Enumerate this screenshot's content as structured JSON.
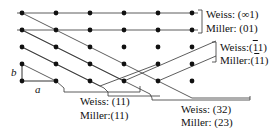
{
  "diagram": {
    "title": "",
    "lattice": {
      "columns_x": [
        22,
        56,
        90,
        124,
        158,
        192
      ],
      "rows_y": [
        13,
        30,
        47,
        64,
        81
      ],
      "dot_color": "#111111",
      "line_color": "#333333"
    },
    "axis_labels": {
      "a": "a",
      "b": "b"
    },
    "planes": [
      {
        "weiss": "Weiss: (∞1)",
        "miller": "Miller: (01)"
      },
      {
        "weiss_prefix": "Weiss:(",
        "weiss_bar": "1",
        "weiss_suffix": "1)",
        "miller_prefix": "Miller:(",
        "miller_bar": "1",
        "miller_suffix": "1)"
      },
      {
        "weiss": "Weiss: (11)",
        "miller": "Miller:(11)"
      },
      {
        "weiss": "Weiss: (32)",
        "miller": "Miller: (23)"
      }
    ]
  }
}
